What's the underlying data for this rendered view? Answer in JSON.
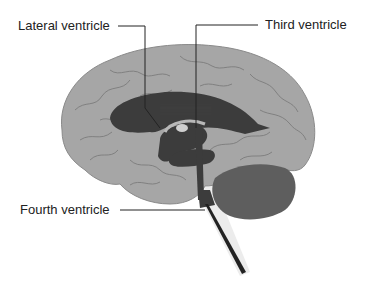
{
  "diagram": {
    "labels": [
      {
        "id": "lateral",
        "text": "Lateral ventricle"
      },
      {
        "id": "third",
        "text": "Third ventricle"
      },
      {
        "id": "fourth",
        "text": "Fourth ventricle"
      }
    ],
    "colors": {
      "background": "#ffffff",
      "cerebrum": "#a6a6a6",
      "sulci": "#7c7c7c",
      "ventricles": "#3c3c3c",
      "cerebellum": "#5e5e5e",
      "brainstem_shadow": "#e6e6e6",
      "leader_lines": "#222222",
      "label_text": "#222222"
    }
  }
}
